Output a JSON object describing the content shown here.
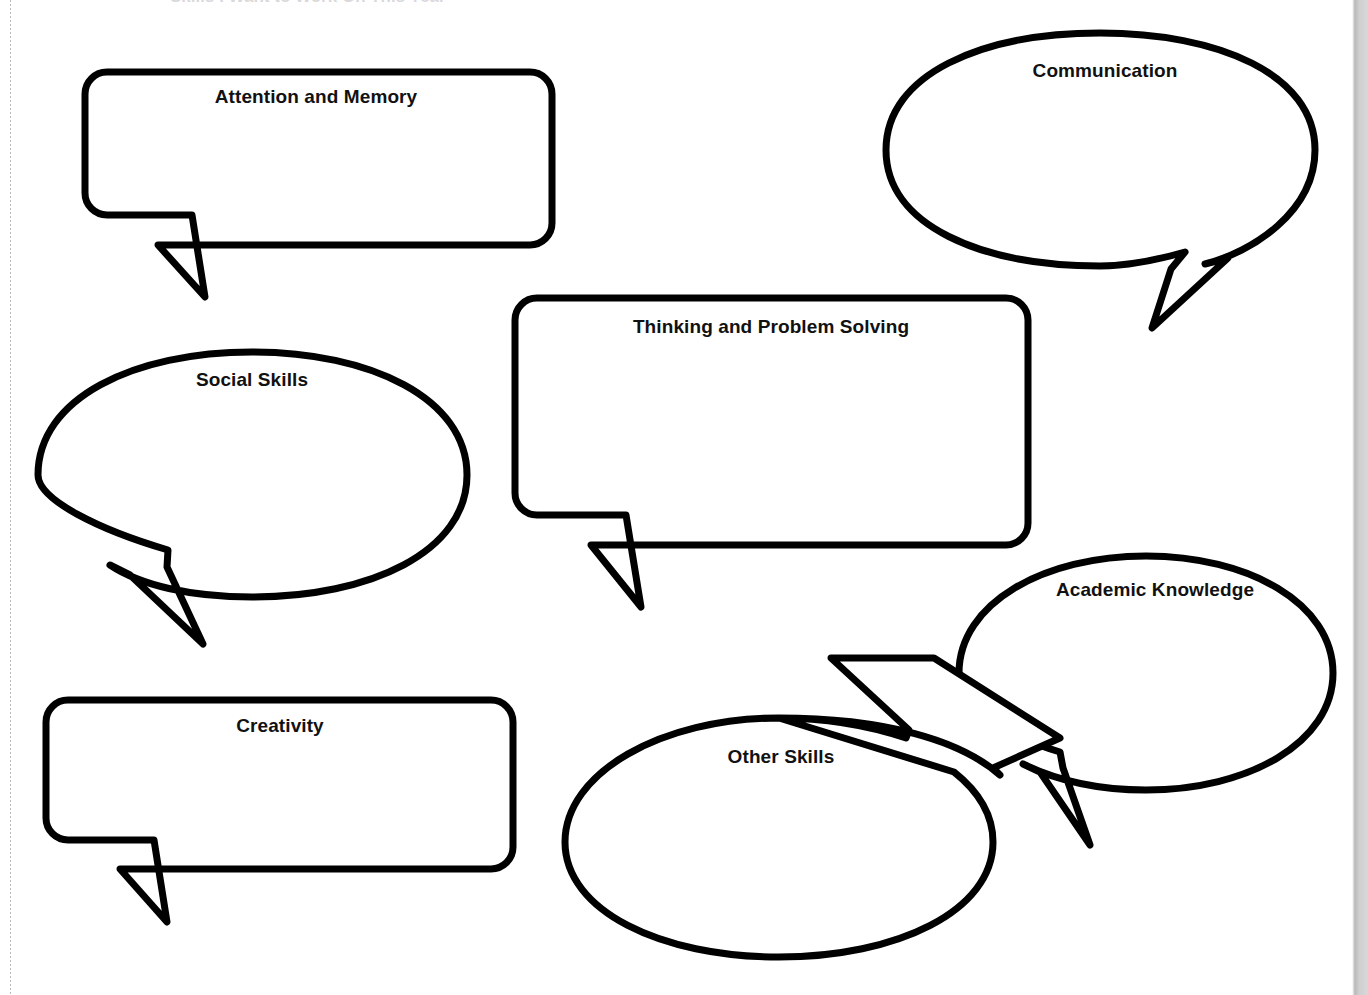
{
  "page": {
    "background_color": "#ffffff",
    "stroke_color": "#000000",
    "text_color": "#111111",
    "clipped_header_text": "Skills I Want to Work On This Year",
    "worksheet_type": "blank speech-bubble brainstorm organizer"
  },
  "bubbles": [
    {
      "id": "attention-and-memory",
      "label": "Attention and Memory",
      "shape": "rounded-rectangle",
      "font_size": 19,
      "label_x": 316,
      "label_y": 97,
      "tail_direction": "down-left"
    },
    {
      "id": "communication",
      "label": "Communication",
      "shape": "ellipse",
      "font_size": 19,
      "label_x": 1105,
      "label_y": 71,
      "tail_direction": "down-left"
    },
    {
      "id": "social-skills",
      "label": "Social Skills",
      "shape": "ellipse",
      "font_size": 19,
      "label_x": 252,
      "label_y": 380,
      "tail_direction": "down-right"
    },
    {
      "id": "thinking-and-problem-solving",
      "label": "Thinking and Problem Solving",
      "shape": "rounded-rectangle",
      "font_size": 19,
      "label_x": 771,
      "label_y": 327,
      "tail_direction": "down-left"
    },
    {
      "id": "academic-knowledge",
      "label": "Academic Knowledge",
      "shape": "ellipse",
      "font_size": 19,
      "label_x": 1155,
      "label_y": 590,
      "tail_direction": "down-left"
    },
    {
      "id": "creativity",
      "label": "Creativity",
      "shape": "rounded-rectangle",
      "font_size": 19,
      "label_x": 280,
      "label_y": 726,
      "tail_direction": "down-left"
    },
    {
      "id": "other-skills",
      "label": "Other Skills",
      "shape": "ellipse",
      "font_size": 19,
      "label_x": 781,
      "label_y": 757,
      "tail_direction": "up-left"
    }
  ]
}
